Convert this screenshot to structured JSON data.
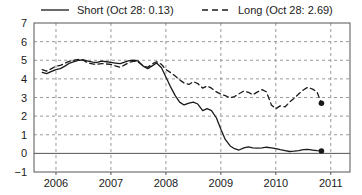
{
  "chart_data": {
    "type": "line",
    "title": "",
    "subtitle": "",
    "xlabel": "",
    "ylabel": "",
    "xlim": [
      2005.6,
      2011.35
    ],
    "ylim": [
      -1,
      7
    ],
    "grid": true,
    "legend_position": "top",
    "x_ticks": [
      "2006",
      "2007",
      "2008",
      "2009",
      "2010",
      "2011"
    ],
    "x_tick_values": [
      2006,
      2007,
      2008,
      2009,
      2010,
      2011
    ],
    "y_ticks": [
      "7",
      "6",
      "5",
      "4",
      "3",
      "2",
      "1",
      "0",
      "−1"
    ],
    "y_tick_values": [
      7,
      6,
      5,
      4,
      3,
      2,
      1,
      0,
      -1
    ],
    "zero_line": 0,
    "series": [
      {
        "name": "Short",
        "legend_label": "Short (Oct 28: 0.13)",
        "style": "solid",
        "color": "#1a1a1a",
        "end_marker": true,
        "end_value": 0.13,
        "end_label": "Oct 28: 0.13",
        "x": [
          2005.75,
          2005.83,
          2005.92,
          2006.0,
          2006.08,
          2006.17,
          2006.25,
          2006.33,
          2006.42,
          2006.5,
          2006.58,
          2006.67,
          2006.75,
          2006.83,
          2006.92,
          2007.0,
          2007.08,
          2007.17,
          2007.25,
          2007.33,
          2007.42,
          2007.5,
          2007.58,
          2007.67,
          2007.75,
          2007.83,
          2007.92,
          2008.0,
          2008.08,
          2008.17,
          2008.25,
          2008.33,
          2008.42,
          2008.5,
          2008.58,
          2008.67,
          2008.75,
          2008.83,
          2008.92,
          2009.0,
          2009.08,
          2009.17,
          2009.25,
          2009.33,
          2009.42,
          2009.5,
          2009.58,
          2009.67,
          2009.75,
          2009.83,
          2009.92,
          2010.0,
          2010.08,
          2010.17,
          2010.25,
          2010.33,
          2010.42,
          2010.5,
          2010.58,
          2010.67,
          2010.75,
          2010.83
        ],
        "y": [
          4.35,
          4.28,
          4.4,
          4.5,
          4.55,
          4.7,
          4.85,
          4.92,
          5.0,
          5.02,
          4.95,
          4.9,
          4.88,
          4.95,
          4.92,
          4.88,
          4.85,
          4.82,
          4.9,
          4.98,
          5.0,
          4.95,
          4.7,
          4.55,
          4.7,
          4.85,
          4.6,
          4.1,
          3.6,
          3.1,
          2.75,
          2.6,
          2.7,
          2.75,
          2.65,
          2.3,
          2.4,
          2.3,
          1.9,
          1.3,
          0.75,
          0.4,
          0.25,
          0.18,
          0.3,
          0.35,
          0.3,
          0.28,
          0.3,
          0.33,
          0.3,
          0.25,
          0.2,
          0.15,
          0.1,
          0.12,
          0.15,
          0.2,
          0.22,
          0.18,
          0.15,
          0.13
        ]
      },
      {
        "name": "Long",
        "legend_label": "Long (Oct 28: 2.69)",
        "style": "dashed",
        "color": "#1a1a1a",
        "end_marker": true,
        "end_value": 2.69,
        "end_label": "Oct 28: 2.69",
        "x": [
          2005.75,
          2005.83,
          2005.92,
          2006.0,
          2006.08,
          2006.17,
          2006.25,
          2006.33,
          2006.42,
          2006.5,
          2006.58,
          2006.67,
          2006.75,
          2006.83,
          2006.92,
          2007.0,
          2007.08,
          2007.17,
          2007.25,
          2007.33,
          2007.42,
          2007.5,
          2007.58,
          2007.67,
          2007.75,
          2007.83,
          2007.92,
          2008.0,
          2008.08,
          2008.17,
          2008.25,
          2008.33,
          2008.42,
          2008.5,
          2008.58,
          2008.67,
          2008.75,
          2008.83,
          2008.92,
          2009.0,
          2009.08,
          2009.17,
          2009.25,
          2009.33,
          2009.42,
          2009.5,
          2009.58,
          2009.67,
          2009.75,
          2009.83,
          2009.92,
          2010.0,
          2010.08,
          2010.17,
          2010.25,
          2010.33,
          2010.42,
          2010.5,
          2010.58,
          2010.67,
          2010.75,
          2010.83
        ],
        "y": [
          4.5,
          4.42,
          4.55,
          4.68,
          4.72,
          4.85,
          4.95,
          5.0,
          5.05,
          5.0,
          4.85,
          4.8,
          4.78,
          4.82,
          4.8,
          4.78,
          4.7,
          4.62,
          4.75,
          4.88,
          4.95,
          4.9,
          4.72,
          4.62,
          4.8,
          4.92,
          4.78,
          4.5,
          4.35,
          4.15,
          3.95,
          3.78,
          3.7,
          3.85,
          3.75,
          3.5,
          3.62,
          3.5,
          3.3,
          3.18,
          3.1,
          2.98,
          3.05,
          3.2,
          3.35,
          3.28,
          3.15,
          3.3,
          3.42,
          3.3,
          2.6,
          2.4,
          2.55,
          2.5,
          2.75,
          2.95,
          3.2,
          3.4,
          3.55,
          3.45,
          3.3,
          2.69
        ]
      }
    ]
  },
  "axes": {
    "left_label": "",
    "bottom_label": ""
  }
}
